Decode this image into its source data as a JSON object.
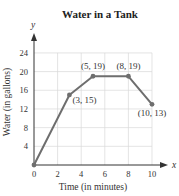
{
  "chart_data": {
    "type": "line",
    "title": "Water in a Tank",
    "xlabel": "Time (in minutes)",
    "ylabel": "Water (in gallons)",
    "x_axis_letter": "x",
    "y_axis_letter": "y",
    "xlim": [
      0,
      10
    ],
    "ylim": [
      0,
      24
    ],
    "xticks": [
      0,
      2,
      4,
      6,
      8,
      10
    ],
    "yticks": [
      4,
      8,
      12,
      16,
      20,
      24
    ],
    "grid": true,
    "legend": "none",
    "series": [
      {
        "name": "Water in a Tank",
        "color": "#6e6e6e",
        "x": [
          0,
          3,
          5,
          8,
          10
        ],
        "y": [
          0,
          15,
          19,
          19,
          13
        ]
      }
    ],
    "annotations": [
      {
        "text": "(3, 15)",
        "x": 3,
        "y": 15
      },
      {
        "text": "(5, 19)",
        "x": 5,
        "y": 19
      },
      {
        "text": "(8, 19)",
        "x": 8,
        "y": 19
      },
      {
        "text": "(10, 13)",
        "x": 10,
        "y": 13
      }
    ]
  }
}
